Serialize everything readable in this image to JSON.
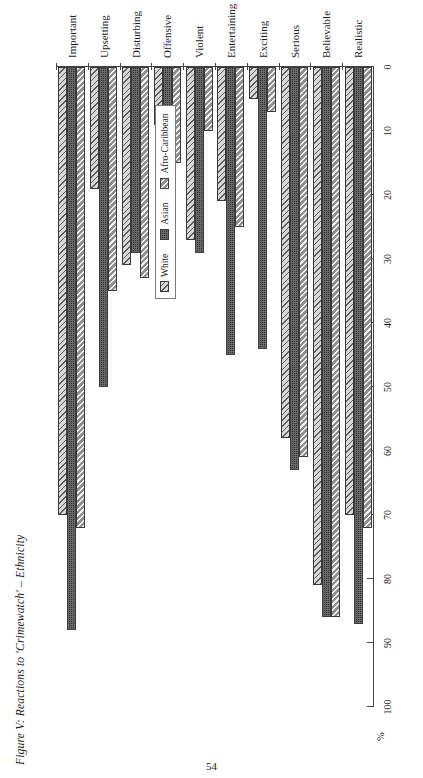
{
  "page": {
    "number": "54"
  },
  "figure": {
    "title": "Figure V: Reactions to 'Crimewatch' – Ethnicity",
    "legend": {
      "items": [
        {
          "label": "White",
          "pattern": "diagonal-hatch-light"
        },
        {
          "label": "Asian",
          "pattern": "dark-dotted-solid"
        },
        {
          "label": "Afro-Caribbean",
          "pattern": "diagonal-hatch-medium"
        }
      ]
    }
  },
  "chart_data": {
    "type": "bar",
    "orientation": "horizontal-rotated",
    "title": "Figure V: Reactions to 'Crimewatch' – Ethnicity",
    "xlabel": "",
    "ylabel": "%",
    "ylim": [
      0,
      100
    ],
    "yticks": [
      0,
      10,
      20,
      30,
      40,
      50,
      60,
      70,
      80,
      90,
      100
    ],
    "ytick_labels": [
      "0",
      "10",
      "20",
      "30",
      "40",
      "50",
      "60",
      "70",
      "80",
      "90",
      "100"
    ],
    "grid": false,
    "legend_position": "inside-center",
    "categories": [
      "Realistic",
      "Believable",
      "Serious",
      "Exciting",
      "Entertaining",
      "Violent",
      "Offensive",
      "Disturbing",
      "Upsetting",
      "Important"
    ],
    "series": [
      {
        "name": "White",
        "values": [
          70,
          81,
          58,
          5,
          21,
          27,
          9,
          31,
          19,
          70
        ]
      },
      {
        "name": "Asian",
        "values": [
          87,
          86,
          63,
          44,
          45,
          29,
          25,
          29,
          50,
          88
        ]
      },
      {
        "name": "Afro-Caribbean",
        "values": [
          72,
          86,
          61,
          7,
          25,
          10,
          15,
          33,
          35,
          72
        ]
      }
    ]
  }
}
